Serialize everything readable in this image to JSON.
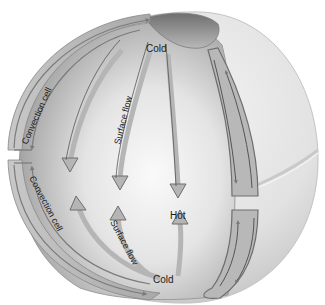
{
  "figure": {
    "labels": {
      "cold_top": "Cold",
      "cold_bottom": "Cold",
      "hot": "Hot",
      "surface_flow_upper": "Surface flow",
      "surface_flow_lower": "Surface flow",
      "convection_cell_upper": "Convection cell",
      "convection_cell_lower": "Convection cell"
    },
    "colors": {
      "background": "#ffffff",
      "sphere_light": "#eeeeee",
      "sphere_shadow": "#9a9a9a",
      "cut_face_light": "#f7f7f7",
      "cut_face_dark": "#8e8e8e",
      "arrow_fill": "#b5b5b5",
      "arrow_stroke": "#6e6e6e",
      "text": "#1a1a1a"
    }
  }
}
